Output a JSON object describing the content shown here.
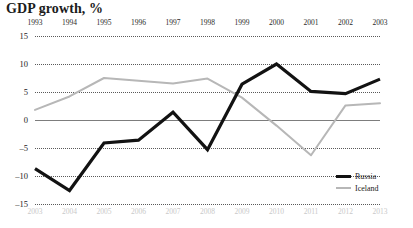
{
  "chart_data": {
    "type": "line",
    "title": "GDP growth, %",
    "xlabel": "",
    "ylabel": "",
    "ylim": [
      -15,
      15
    ],
    "yticks": [
      15,
      10,
      5,
      0,
      -5,
      -10,
      -15
    ],
    "grid": true,
    "legend_position": "bottom-right",
    "axes": {
      "top_axis_label": "Russia years",
      "bottom_axis_label": "Iceland years",
      "top_categories": [
        "1993",
        "1994",
        "1995",
        "1996",
        "1997",
        "1998",
        "1999",
        "2000",
        "2001",
        "2002",
        "2003"
      ],
      "bottom_categories": [
        "2003",
        "2004",
        "2005",
        "2006",
        "2007",
        "2008",
        "2009",
        "2010",
        "2011",
        "2012",
        "2013"
      ]
    },
    "series": [
      {
        "name": "Russia",
        "color": "#121212",
        "axis": "top",
        "x": [
          "1993",
          "1994",
          "1995",
          "1996",
          "1997",
          "1998",
          "1999",
          "2000",
          "2001",
          "2002",
          "2003"
        ],
        "values": [
          -8.7,
          -12.6,
          -4.1,
          -3.6,
          1.4,
          -5.3,
          6.4,
          10.0,
          5.1,
          4.7,
          7.3
        ]
      },
      {
        "name": "Iceland",
        "color": "#b7b7b7",
        "axis": "bottom",
        "x": [
          "2003",
          "2004",
          "2005",
          "2006",
          "2007",
          "2008",
          "2009",
          "2010",
          "2011",
          "2012",
          "2013"
        ],
        "values": [
          1.8,
          4.2,
          7.5,
          7.0,
          6.5,
          7.4,
          4.0,
          -1.0,
          -6.3,
          2.6,
          3.0
        ]
      }
    ]
  },
  "legend": {
    "russia_label": "Russia",
    "iceland_label": "Iceland"
  },
  "colors": {
    "russia": "#121212",
    "iceland": "#b7b7b7",
    "grid": "#5a5a5a",
    "zero_line": "#7d7d7d",
    "bottom_year_text": "#c9c9c9"
  }
}
